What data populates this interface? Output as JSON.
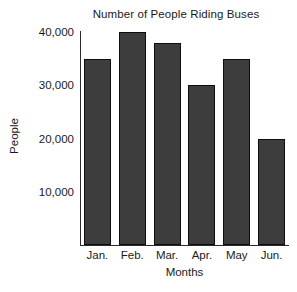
{
  "chart_data": {
    "type": "bar",
    "title": "Number of People Riding Buses",
    "xlabel": "Months",
    "ylabel": "People",
    "categories": [
      "Jan.",
      "Feb.",
      "Mar.",
      "Apr.",
      "May",
      "Jun."
    ],
    "values": [
      35000,
      40000,
      38000,
      30000,
      35000,
      20000
    ],
    "value_labels": [
      "35,000",
      "40,000",
      "38,000",
      "30,000",
      "35,000",
      "20,000"
    ],
    "ytick_labels": [
      "10,000",
      "20,000",
      "30,000",
      "40,000"
    ],
    "ytick_values": [
      10000,
      20000,
      30000,
      40000
    ],
    "ylim": [
      0,
      40000
    ],
    "grid": false,
    "legend": "none",
    "bar_color": "#3d3d3d",
    "bar_edge_color": "#0d0d0d",
    "background_color": "#ffffff",
    "axis_color": "#2b2b2b"
  }
}
